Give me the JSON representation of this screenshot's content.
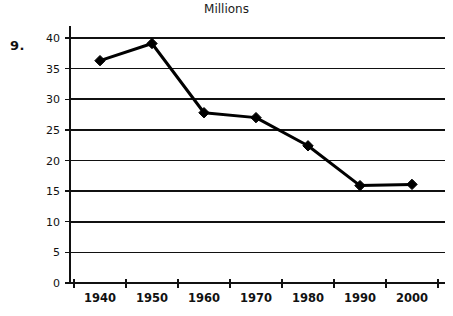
{
  "problem": {
    "number": "9."
  },
  "chart_data": {
    "type": "line",
    "title": "Millions",
    "xlabel": "",
    "ylabel": "",
    "categories": [
      "1940",
      "1950",
      "1960",
      "1970",
      "1980",
      "1990",
      "2000"
    ],
    "x": [
      1940,
      1950,
      1960,
      1970,
      1980,
      1990,
      2000
    ],
    "values": [
      36.3,
      39.1,
      27.8,
      27.0,
      22.4,
      15.9,
      16.1
    ],
    "series": [
      {
        "name": "Millions",
        "values": [
          36.3,
          39.1,
          27.8,
          27.0,
          22.4,
          15.9,
          16.1
        ]
      }
    ],
    "ylim": [
      0,
      40
    ],
    "yticks": [
      0,
      5,
      10,
      15,
      20,
      25,
      30,
      35,
      40
    ],
    "ytick_labels": [
      "0",
      "5",
      "10",
      "15",
      "20",
      "25",
      "30",
      "35",
      "40"
    ],
    "xtick_labels": [
      "1940",
      "1950",
      "1960",
      "1970",
      "1980",
      "1990",
      "2000"
    ],
    "grid": true,
    "grid_axis": "y",
    "legend": false,
    "legend_position": "none",
    "marker": "diamond",
    "line_color": "#000000",
    "marker_color": "#000000",
    "grid_color": "#111111",
    "background_color": "#ffffff"
  }
}
